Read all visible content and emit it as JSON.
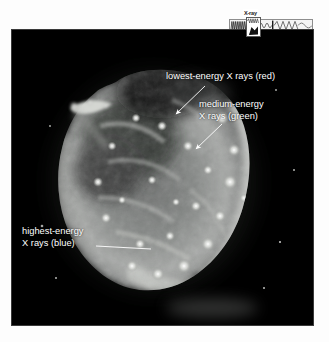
{
  "figure": {
    "kind": "astronomical-x-ray-image"
  },
  "spectrum": {
    "label": "X-ray",
    "marker_name": "x-ray-band-pointer",
    "strip_name": "electromagnetic-spectrum-strip"
  },
  "annotations": [
    {
      "id": "lowest",
      "line1": "lowest-energy X rays (red)",
      "line2": "",
      "color_word": "red",
      "pointer": "arrow"
    },
    {
      "id": "medium",
      "line1": "medium-energy",
      "line2": "X rays (green)",
      "color_word": "green",
      "pointer": "arrow"
    },
    {
      "id": "highest",
      "line1": "highest-energy",
      "line2": "X rays (blue)",
      "color_word": "blue",
      "pointer": "leader-line"
    }
  ],
  "colors": {
    "panel_background": "#000000",
    "page_background": "#ffffff",
    "annotation_text": "#ffffff",
    "nebula_bright": "#f4f4f2",
    "nebula_mid": "#8f9190",
    "nebula_dim": "#3c3e3e"
  }
}
